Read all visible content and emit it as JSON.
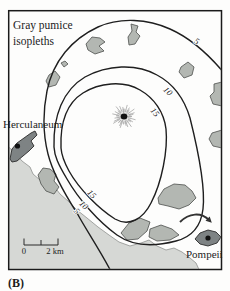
{
  "panel_label": "(B)",
  "title": {
    "line1": "Gray pumice",
    "line2": "isopleths"
  },
  "places": {
    "herculaneum": "Herculaneum",
    "pompeii": "Pompeii"
  },
  "isopleths": {
    "outer": "5",
    "middle": "10",
    "inner": "15"
  },
  "scale_bar": {
    "zero": "0",
    "max": "2 km"
  },
  "colors": {
    "sea": "#d6d8d5",
    "urban_patch": "#b3b7b2",
    "site_patch": "#7e8384",
    "contour": "#1f1f1f",
    "background": "#fdfdfc"
  },
  "map_data": {
    "type": "isopleth-map",
    "title": "Gray pumice isopleths",
    "isopleth_values": [
      5,
      10,
      15
    ],
    "places": [
      "Herculaneum",
      "Pompeii"
    ],
    "scale": {
      "from": 0,
      "to": 2,
      "unit": "km"
    },
    "features": [
      "volcanic vent starburst symbol near map center",
      "three nested isopleth contours labeled 5, 10, 15",
      "coastline with sea in lower left",
      "scattered gray urban patches",
      "arrow pointing to Pompeii"
    ]
  }
}
